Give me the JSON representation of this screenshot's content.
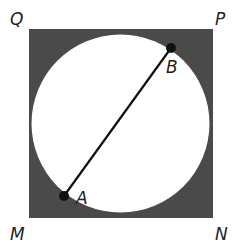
{
  "diagram": {
    "colors": {
      "background": "#ffffff",
      "shaded_region": "#4a4a4a",
      "circle_fill": "#ffffff",
      "segment": "#111111",
      "point": "#111111",
      "label": "#222222"
    },
    "square": {
      "x": 29,
      "y": 29,
      "width": 184,
      "height": 189,
      "vertices": {
        "Q": {
          "label": "Q",
          "x": 29,
          "y": 29
        },
        "P": {
          "label": "P",
          "x": 213,
          "y": 29
        },
        "N": {
          "label": "N",
          "x": 213,
          "y": 218
        },
        "M": {
          "label": "M",
          "x": 29,
          "y": 218
        }
      }
    },
    "circle": {
      "cx": 120.5,
      "cy": 123.5,
      "r": 89
    },
    "segment_AB": {
      "from": "A",
      "to": "B"
    },
    "points": {
      "A": {
        "label": "A",
        "x": 64,
        "y": 196
      },
      "B": {
        "label": "B",
        "x": 171,
        "y": 48
      }
    },
    "labels": {
      "Q": {
        "text": "Q",
        "x": 10,
        "y": 25
      },
      "P": {
        "text": "P",
        "x": 215,
        "y": 25
      },
      "M": {
        "text": "M",
        "x": 10,
        "y": 240
      },
      "N": {
        "text": "N",
        "x": 215,
        "y": 240
      },
      "A": {
        "text": "A",
        "x": 76,
        "y": 204
      },
      "B": {
        "text": "B",
        "x": 166,
        "y": 73
      }
    }
  }
}
